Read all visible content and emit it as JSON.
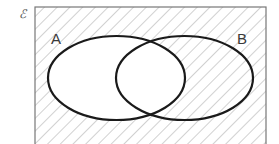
{
  "diagram": {
    "type": "venn",
    "universal_set_symbol": "ℰ",
    "sets": [
      {
        "label": "A",
        "cx": 116.5,
        "cy": 78,
        "rx": 68.5,
        "ry": 42
      },
      {
        "label": "B",
        "cx": 184.5,
        "cy": 78,
        "rx": 68.5,
        "ry": 42
      }
    ],
    "shaded_region": "A'",
    "shading_style": "diagonal-hatch",
    "colors": {
      "outline": "#1a1a1a",
      "frame": "#777777",
      "hatch": "#b8b8b8",
      "background": "#ffffff"
    }
  },
  "labels": {
    "universal": "ℰ",
    "set_a": "A",
    "set_b": "B"
  }
}
